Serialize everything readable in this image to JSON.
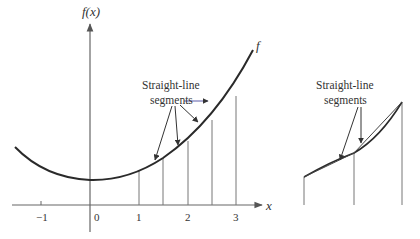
{
  "main_plot": {
    "y_axis_label": "f(x)",
    "x_axis_label": "x",
    "curve_label": "f",
    "x_tick_labels": [
      "−1",
      "0",
      "1",
      "2",
      "3"
    ],
    "callout": "Straight-line segments",
    "callout_line1": "Straight-line",
    "callout_line2": "segments",
    "segment_x_values": [
      1,
      1.5,
      2,
      2.5,
      3
    ]
  },
  "inset": {
    "callout_line1": "Straight-line",
    "callout_line2": "segments"
  },
  "colors": {
    "axis": "#666666",
    "curve": "#2a2a2a",
    "arrow": "#333333",
    "callout_arrow_blue": "#5a5aa8"
  }
}
